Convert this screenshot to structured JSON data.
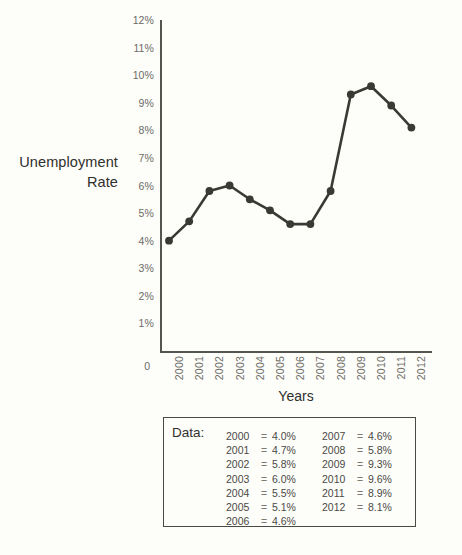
{
  "chart_data": {
    "type": "line",
    "title": "",
    "xlabel": "Years",
    "ylabel": "Unemployment Rate",
    "categories": [
      "2000",
      "2001",
      "2002",
      "2003",
      "2004",
      "2005",
      "2006",
      "2007",
      "2008",
      "2009",
      "2010",
      "2011",
      "2012"
    ],
    "values": [
      4.0,
      4.7,
      5.8,
      6.0,
      5.5,
      5.1,
      4.6,
      4.6,
      5.8,
      9.3,
      9.6,
      8.9,
      8.1
    ],
    "ylim": [
      0,
      12
    ],
    "ytick_labels": [
      "12%",
      "11%",
      "10%",
      "9%",
      "8%",
      "7%",
      "6%",
      "5%",
      "4%",
      "3%",
      "2%",
      "1%"
    ],
    "ytick_values": [
      12,
      11,
      10,
      9,
      8,
      7,
      6,
      5,
      4,
      3,
      2,
      1
    ],
    "origin_label": "0",
    "grid": false,
    "legend": "none",
    "marker": "circle",
    "line_color": "#3a3a35",
    "marker_color": "#3a3a35",
    "axis_color": "#55554f",
    "tick_label_color": "#6c6c66",
    "unit_suffix": "%"
  },
  "axis": {
    "y_label_line1": "Unemployment",
    "y_label_line2": "Rate",
    "x_label": "Years"
  },
  "data_box": {
    "title": "Data:",
    "separator": "=",
    "column_left": [
      {
        "year": "2000",
        "value": "4.0%"
      },
      {
        "year": "2001",
        "value": "4.7%"
      },
      {
        "year": "2002",
        "value": "5.8%"
      },
      {
        "year": "2003",
        "value": "6.0%"
      },
      {
        "year": "2004",
        "value": "5.5%"
      },
      {
        "year": "2005",
        "value": "5.1%"
      },
      {
        "year": "2006",
        "value": "4.6%"
      }
    ],
    "column_right": [
      {
        "year": "2007",
        "value": "4.6%"
      },
      {
        "year": "2008",
        "value": "5.8%"
      },
      {
        "year": "2009",
        "value": "9.3%"
      },
      {
        "year": "2010",
        "value": "9.6%"
      },
      {
        "year": "2011",
        "value": "8.9%"
      },
      {
        "year": "2012",
        "value": "8.1%"
      }
    ]
  }
}
